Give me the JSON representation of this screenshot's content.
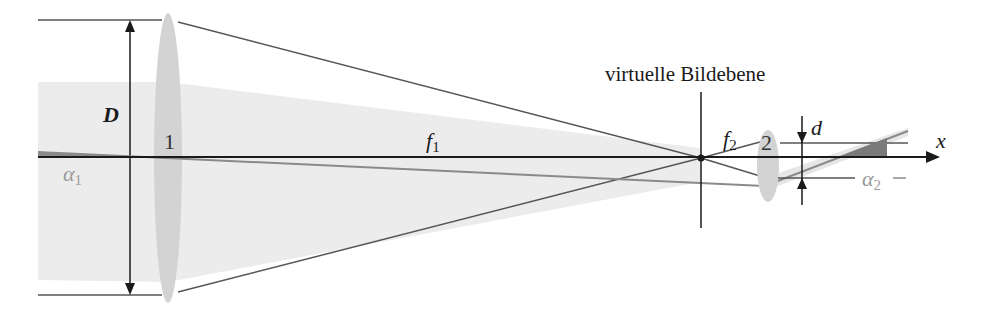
{
  "diagram": {
    "type": "optical-ray-diagram",
    "labels": {
      "diameter": "D",
      "lens1": "1",
      "lens2": "2",
      "focal1_base": "f",
      "focal1_sub": "1",
      "focal2_base": "f",
      "focal2_sub": "2",
      "image_plane": "virtuelle Bildebene",
      "offset": "d",
      "axis": "x",
      "angle1_base": "α",
      "angle1_sub": "1",
      "angle2_base": "α",
      "angle2_sub": "2"
    },
    "elements": [
      {
        "id": "lens-1",
        "kind": "converging-lens",
        "label": "1"
      },
      {
        "id": "lens-2",
        "kind": "converging-lens",
        "label": "2"
      },
      {
        "id": "virtual-image-plane",
        "kind": "plane",
        "label": "virtuelle Bildebene"
      },
      {
        "id": "optical-axis",
        "kind": "axis",
        "label": "x"
      }
    ],
    "colors": {
      "line": "#1a1a1a",
      "ray": "#555555",
      "lens": "#d2d2d2",
      "beam": "#ebebeb",
      "angle_fill": "#7a7a7a",
      "angle_label": "#9a9a9a"
    }
  }
}
